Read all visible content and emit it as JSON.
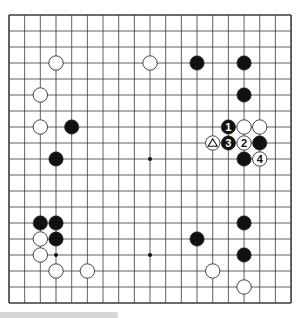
{
  "board": {
    "size": 19,
    "origin_x": 9,
    "origin_y": 15,
    "spacing_x": 15.67,
    "spacing_y": 16.0,
    "line_color": "#3a3a3a",
    "background": "#ffffff",
    "star_points": [
      [
        3,
        3
      ],
      [
        9,
        3
      ],
      [
        15,
        3
      ],
      [
        3,
        9
      ],
      [
        9,
        9
      ],
      [
        15,
        9
      ],
      [
        3,
        15
      ],
      [
        9,
        15
      ],
      [
        15,
        15
      ]
    ]
  },
  "stones": [
    {
      "color": "white",
      "col": 3,
      "row": 3
    },
    {
      "color": "white",
      "col": 9,
      "row": 3
    },
    {
      "color": "black",
      "col": 12,
      "row": 3
    },
    {
      "color": "black",
      "col": 15,
      "row": 3
    },
    {
      "color": "white",
      "col": 2,
      "row": 5
    },
    {
      "color": "black",
      "col": 15,
      "row": 5
    },
    {
      "color": "white",
      "col": 2,
      "row": 7
    },
    {
      "color": "black",
      "col": 4,
      "row": 7
    },
    {
      "color": "black",
      "col": 14,
      "row": 7,
      "label": "1"
    },
    {
      "color": "white",
      "col": 15,
      "row": 7
    },
    {
      "color": "white",
      "col": 16,
      "row": 7
    },
    {
      "color": "white",
      "col": 13,
      "row": 8,
      "label": "△"
    },
    {
      "color": "black",
      "col": 14,
      "row": 8,
      "label": "3"
    },
    {
      "color": "white",
      "col": 15,
      "row": 8,
      "label": "2"
    },
    {
      "color": "black",
      "col": 16,
      "row": 8
    },
    {
      "color": "black",
      "col": 3,
      "row": 9
    },
    {
      "color": "black",
      "col": 15,
      "row": 9
    },
    {
      "color": "white",
      "col": 16,
      "row": 9,
      "label": "4"
    },
    {
      "color": "black",
      "col": 2,
      "row": 13
    },
    {
      "color": "black",
      "col": 3,
      "row": 13
    },
    {
      "color": "black",
      "col": 15,
      "row": 13
    },
    {
      "color": "white",
      "col": 2,
      "row": 14
    },
    {
      "color": "black",
      "col": 3,
      "row": 14
    },
    {
      "color": "black",
      "col": 12,
      "row": 14
    },
    {
      "color": "white",
      "col": 2,
      "row": 15
    },
    {
      "color": "black",
      "col": 15,
      "row": 15
    },
    {
      "color": "white",
      "col": 3,
      "row": 16
    },
    {
      "color": "white",
      "col": 5,
      "row": 16
    },
    {
      "color": "white",
      "col": 13,
      "row": 16
    },
    {
      "color": "white",
      "col": 15,
      "row": 17
    }
  ],
  "colors": {
    "black_stone": "#111111",
    "white_stone": "#ffffff",
    "stone_outline": "#333333",
    "bottom_bar": "#d6d6d6"
  }
}
